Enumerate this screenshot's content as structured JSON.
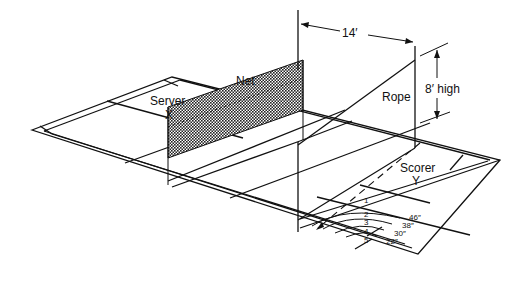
{
  "figure": {
    "type": "court-layout-perspective-diagram",
    "background": "#ffffff",
    "ink": "#111111"
  },
  "labels": {
    "net": "Net",
    "server": "Server",
    "server_mark": "X",
    "scorer": "Scorer",
    "scorer_mark": "Y",
    "rope": "Rope",
    "height": "8′ high",
    "distance": "14′"
  },
  "target_zones": [
    {
      "number": "1",
      "radius": ""
    },
    {
      "number": "2",
      "radius": "46″"
    },
    {
      "number": "3",
      "radius": "38″"
    },
    {
      "number": "4",
      "radius": "30″"
    },
    {
      "number": "5",
      "radius": "22″"
    }
  ]
}
